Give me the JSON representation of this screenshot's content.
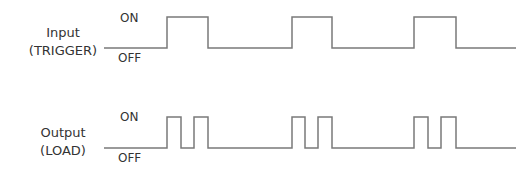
{
  "colors": {
    "line": "#7a7a7a",
    "text": "#333333",
    "background": "#ffffff"
  },
  "signals": [
    {
      "id": "input",
      "label_line1": "Input",
      "label_line2": "(TRIGGER)",
      "on_label": "ON",
      "off_label": "OFF",
      "high_y": 17,
      "low_y": 48,
      "x_start": 104,
      "x_end": 516,
      "pulses": [
        [
          167,
          208
        ],
        [
          292,
          332
        ],
        [
          414,
          456
        ]
      ]
    },
    {
      "id": "output",
      "label_line1": "Output",
      "label_line2": "(LOAD)",
      "on_label": "ON",
      "off_label": "OFF",
      "high_y": 117,
      "low_y": 148,
      "x_start": 104,
      "x_end": 516,
      "pulses": [
        [
          167,
          181
        ],
        [
          194,
          208
        ],
        [
          292,
          305
        ],
        [
          318,
          332
        ],
        [
          414,
          428
        ],
        [
          441,
          456
        ]
      ]
    }
  ]
}
